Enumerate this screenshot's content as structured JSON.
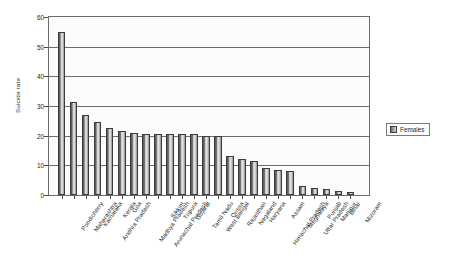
{
  "chart_data": {
    "type": "bar",
    "title": "",
    "subtitle": "",
    "xlabel": "",
    "ylabel": "Suicide rate",
    "ylim": [
      0,
      60
    ],
    "ytick_labels": [
      "60",
      "50",
      "40",
      "30",
      "20",
      "10",
      "0"
    ],
    "ytick_values": [
      60,
      50,
      40,
      30,
      20,
      10,
      0
    ],
    "grid": true,
    "legend_position": "right",
    "legend_entries": [
      "Females"
    ],
    "categories": [
      "Pondicherry",
      "Maharashtra",
      "Karnataka",
      "Andhra Pradesh",
      "Kerala",
      "Goa",
      "Madhya Pradesh",
      "Arunachal Pradesh",
      "Sikkim",
      "Tripura",
      "Gujarat",
      "Tamil Nadu",
      "West Bengal",
      "Orissa",
      "Rajasthan",
      "Nagaland",
      "Haryana",
      "Himachal Pradesh",
      "Assam",
      "Meghalaya",
      "Uttar Pradesh",
      "Punjab",
      "Manipur",
      "Bihar",
      "Mizoram"
    ],
    "series": [
      {
        "name": "Females",
        "values": [
          55.0,
          31.5,
          27.0,
          24.5,
          22.5,
          21.5,
          21.0,
          20.5,
          20.5,
          20.5,
          20.5,
          20.5,
          20.0,
          20.0,
          13.0,
          12.0,
          11.5,
          9.0,
          8.5,
          8.0,
          3.0,
          2.5,
          2.0,
          1.5,
          1.0
        ]
      }
    ]
  },
  "legend": {
    "label": "Females"
  },
  "axes": {
    "y_title": "Suicide rate"
  }
}
